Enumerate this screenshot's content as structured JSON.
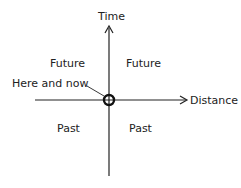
{
  "diagram": {
    "axes": {
      "vertical_label": "Time",
      "horizontal_label": "Distance"
    },
    "origin_label": "Here and now",
    "quadrants": {
      "upper_left": "Future",
      "upper_right": "Future",
      "lower_left": "Past",
      "lower_right": "Past"
    },
    "colors": {
      "line": "#222222",
      "background": "#ffffff"
    }
  }
}
